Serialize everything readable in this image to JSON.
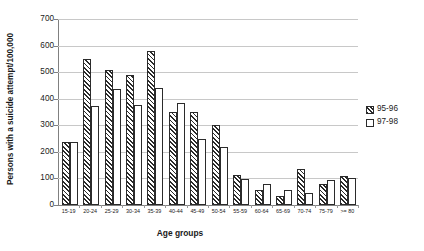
{
  "chart_data": {
    "type": "bar",
    "title": "",
    "xlabel": "Age groups",
    "ylabel": "Persons with a suicide attempt/100,000",
    "ylim": [
      0,
      700
    ],
    "ytick_labels": [
      "700",
      "600",
      "500",
      "400",
      "300",
      "200",
      "100",
      "0"
    ],
    "yticks": [
      700,
      600,
      500,
      400,
      300,
      200,
      100,
      0
    ],
    "grid": true,
    "legend_position": "right",
    "categories": [
      "15-19",
      "20-24",
      "25-29",
      "30-34",
      "35-39",
      "40-44",
      "45-49",
      "50-54",
      "55-59",
      "60-64",
      "65-69",
      "70-74",
      "75-79",
      ">= 80"
    ],
    "series": [
      {
        "name": "95-96",
        "pattern": "diagonal-hatch",
        "values": [
          238,
          550,
          507,
          490,
          578,
          350,
          350,
          300,
          113,
          55,
          33,
          135,
          80,
          110
        ]
      },
      {
        "name": "97-98",
        "pattern": "open",
        "values": [
          238,
          372,
          437,
          378,
          440,
          383,
          247,
          218,
          97,
          80,
          58,
          45,
          95,
          100
        ]
      }
    ]
  },
  "legend": {
    "items": [
      {
        "label": "95-96"
      },
      {
        "label": "97-98"
      }
    ]
  },
  "axes": {
    "y_title": "Persons with a suicide attempt/100,000",
    "x_title": "Age groups"
  }
}
